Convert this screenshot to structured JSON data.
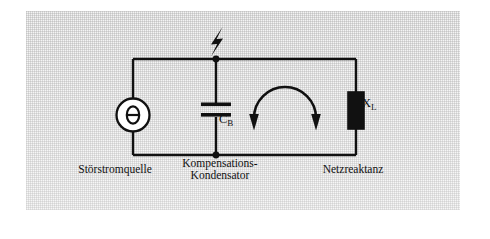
{
  "figure": {
    "kind": "circuit-schematic",
    "language": "de",
    "background_color": "#f2f2f2",
    "line_color": "#111111"
  },
  "labels": {
    "source_caption": "Störstromquelle",
    "capacitor_caption_line1": "Kompensations-",
    "capacitor_caption_line2": "Kondensator",
    "reactance_caption": "Netzreaktanz",
    "capacitor_symbol": "C",
    "capacitor_symbol_subscript": "B",
    "reactance_symbol": "X",
    "reactance_symbol_subscript": "L",
    "source_glyph": "θ"
  },
  "components": [
    {
      "id": "source",
      "type": "current-source",
      "symbol": "θ",
      "caption": "Störstromquelle",
      "branch": "left"
    },
    {
      "id": "capacitor",
      "type": "capacitor",
      "symbol": "C_B",
      "caption": "Kompensations-Kondensator",
      "branch": "middle"
    },
    {
      "id": "reactance",
      "type": "reactance-block",
      "symbol": "X_L",
      "caption": "Netzreaktanz",
      "branch": "right",
      "fill": "#111111"
    }
  ],
  "annotations": {
    "lightning_bolt": "surge-injection-point",
    "loop_arrow": "mesh-current-loop"
  },
  "nodes": [
    {
      "id": "top-node",
      "x": 216,
      "y": 59
    },
    {
      "id": "bottom-node",
      "x": 216,
      "y": 155
    }
  ]
}
